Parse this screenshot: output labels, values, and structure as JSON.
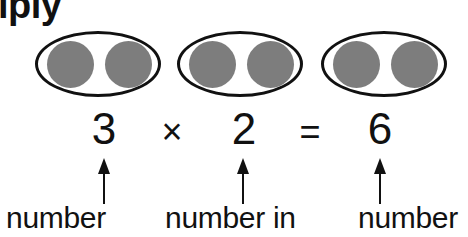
{
  "title_fragment": "iply",
  "groups": [
    {
      "dots": 2
    },
    {
      "dots": 2
    },
    {
      "dots": 2
    }
  ],
  "equation": {
    "factor1": "3",
    "times": "×",
    "factor2": "2",
    "equals": "=",
    "product": "6"
  },
  "labels": {
    "factor1": "number",
    "factor2": "number in",
    "product": "number"
  },
  "colors": {
    "dot_fill": "#7d7d7d",
    "outline": "#111111"
  }
}
